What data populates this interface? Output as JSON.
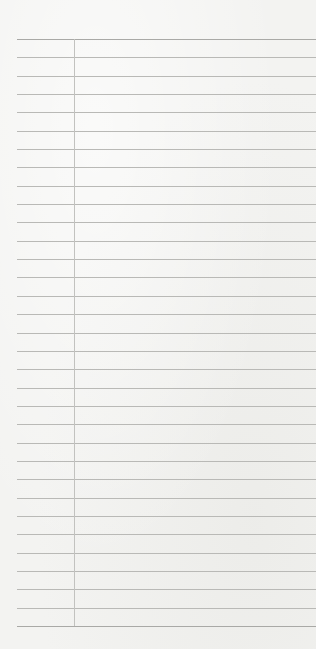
{
  "page": {
    "type": "lined-notepad",
    "title": "",
    "ruled_line_count": 33,
    "has_margin_line": true,
    "colors": {
      "paper": "#f3f3f1",
      "rule": "#b9b9b6",
      "margin_line": "#c2c2bf"
    },
    "lines": []
  }
}
